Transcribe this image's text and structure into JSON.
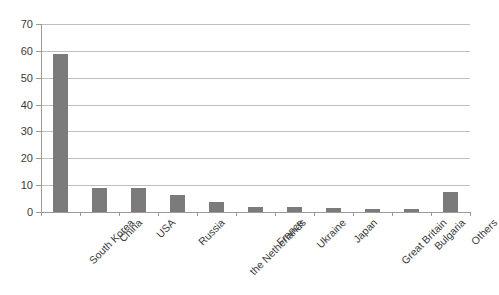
{
  "chart_data": {
    "type": "bar",
    "title": "",
    "xlabel": "",
    "ylabel": "",
    "ylim": [
      0,
      70
    ],
    "y_ticks": [
      0,
      10,
      20,
      30,
      40,
      50,
      60,
      70
    ],
    "grid": true,
    "legend": false,
    "orientation": "vertical",
    "bar_color": "#7b7b7b",
    "categories": [
      "South Korea",
      "China",
      "USA",
      "Russia",
      "the Netherlands",
      "France",
      "Ukraine",
      "Japan",
      "Great Britain",
      "Bulgaria",
      "Others"
    ],
    "values": [
      59,
      8.8,
      9.1,
      6.3,
      3.6,
      1.8,
      1.7,
      1.4,
      1.3,
      1.1,
      7.6
    ]
  },
  "axes": {
    "y_tick_labels": [
      "0",
      "10",
      "20",
      "30",
      "40",
      "50",
      "60",
      "70"
    ],
    "x_tick_labels": [
      "South Korea",
      "China",
      "USA",
      "Russia",
      "the Netherlands",
      "France",
      "Ukraine",
      "Japan",
      "Great Britain",
      "Bulgaria",
      "Others"
    ]
  },
  "figure": {
    "cropped_title_ghost": ""
  }
}
